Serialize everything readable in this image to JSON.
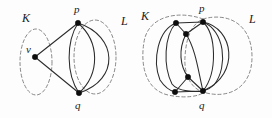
{
  "figure": {
    "background_color": "#fdfdfd",
    "ink_color": "#1a1a1a",
    "region_stroke_color": "#7a7a7a",
    "edge_color": "#2b2b2b",
    "vertex_color": "#0d0d0d",
    "panel_count": 2
  },
  "panels": [
    {
      "id": "left",
      "name": "left-graph-panel",
      "labels": {
        "region_k": "K",
        "region_l": "L",
        "vertex_v": "v",
        "vertex_p": "p",
        "vertex_q": "q"
      },
      "regions": [
        {
          "name": "K",
          "style": "dashed-ellipse",
          "cx": 36,
          "cy": 62,
          "rx": 16,
          "ry": 33
        },
        {
          "name": "L",
          "style": "dashed-ellipse",
          "cx": 95,
          "cy": 57,
          "rx": 21,
          "ry": 37
        }
      ],
      "vertices": [
        {
          "id": "v",
          "x": 35,
          "y": 57,
          "label": "v",
          "label_x": 26,
          "label_y": 44
        },
        {
          "id": "p",
          "x": 78,
          "y": 23,
          "label": "p",
          "label_x": 74,
          "label_y": 4
        },
        {
          "id": "q",
          "x": 79,
          "y": 93,
          "label": "q",
          "label_x": 75,
          "label_y": 100
        }
      ],
      "edges": [
        {
          "from": "v",
          "to": "p",
          "style": "straight"
        },
        {
          "from": "v",
          "to": "q",
          "style": "straight"
        },
        {
          "from": "p",
          "to": "q",
          "style": "curve-left"
        },
        {
          "from": "p",
          "to": "q",
          "style": "curve-mid"
        },
        {
          "from": "p",
          "to": "q",
          "style": "curve-right"
        }
      ],
      "vertex_count": 3,
      "edge_count": 5
    },
    {
      "id": "right",
      "name": "right-graph-panel",
      "labels": {
        "region_k": "K",
        "region_l": "L",
        "vertex_p": "p",
        "vertex_q": "q"
      },
      "regions": [
        {
          "name": "K",
          "style": "dashed-blob",
          "cx": 182,
          "cy": 57,
          "rx": 42,
          "ry": 38
        },
        {
          "name": "L",
          "style": "dashed-blob",
          "cx": 223,
          "cy": 57,
          "rx": 30,
          "ry": 38
        }
      ],
      "vertices": [
        {
          "id": "a",
          "x": 176,
          "y": 23,
          "label": "",
          "label_x": 0,
          "label_y": 0
        },
        {
          "id": "p",
          "x": 203,
          "y": 22,
          "label": "p",
          "label_x": 199,
          "label_y": 3
        },
        {
          "id": "b",
          "x": 186,
          "y": 34,
          "label": "",
          "label_x": 0,
          "label_y": 0
        },
        {
          "id": "c",
          "x": 188,
          "y": 77,
          "label": "",
          "label_x": 0,
          "label_y": 0
        },
        {
          "id": "d",
          "x": 175,
          "y": 92,
          "label": "",
          "label_x": 0,
          "label_y": 0
        },
        {
          "id": "q",
          "x": 203,
          "y": 91,
          "label": "q",
          "label_x": 199,
          "label_y": 100
        }
      ],
      "vertex_count": 6,
      "edge_count": 12
    }
  ],
  "label_positions": {
    "left_k": {
      "text": "K",
      "x": 22,
      "y": 12
    },
    "left_l": {
      "text": "L",
      "x": 121,
      "y": 15
    },
    "right_k": {
      "text": "K",
      "x": 141,
      "y": 10
    },
    "right_l": {
      "text": "L",
      "x": 249,
      "y": 13
    }
  }
}
